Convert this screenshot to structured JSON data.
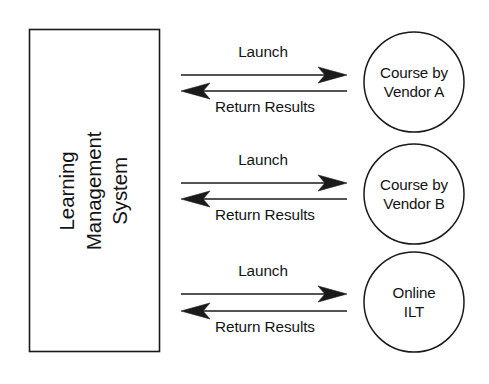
{
  "diagram": {
    "background_color": "#ffffff",
    "stroke_color": "#1a1a1a",
    "text_color": "#141414",
    "system_box": {
      "label_lines": [
        "Learning",
        "Management",
        "System"
      ],
      "orientation": "vertical-rotated-90ccw"
    },
    "nodes": [
      {
        "id": "course-vendor-a",
        "shape": "circle",
        "label_lines": [
          "Course by",
          "Vendor A"
        ]
      },
      {
        "id": "course-vendor-b",
        "shape": "circle",
        "label_lines": [
          "Course by",
          "Vendor B"
        ]
      },
      {
        "id": "online-ilt",
        "shape": "circle",
        "label_lines": [
          "Online",
          "ILT"
        ]
      }
    ],
    "flows": [
      {
        "id": "flow-0",
        "outbound_label": "Launch",
        "inbound_label": "Return Results",
        "outbound_direction": "right",
        "inbound_direction": "left"
      },
      {
        "id": "flow-1",
        "outbound_label": "Launch",
        "inbound_label": "Return Results",
        "outbound_direction": "right",
        "inbound_direction": "left"
      },
      {
        "id": "flow-2",
        "outbound_label": "Launch",
        "inbound_label": "Return Results",
        "outbound_direction": "right",
        "inbound_direction": "left"
      }
    ]
  }
}
